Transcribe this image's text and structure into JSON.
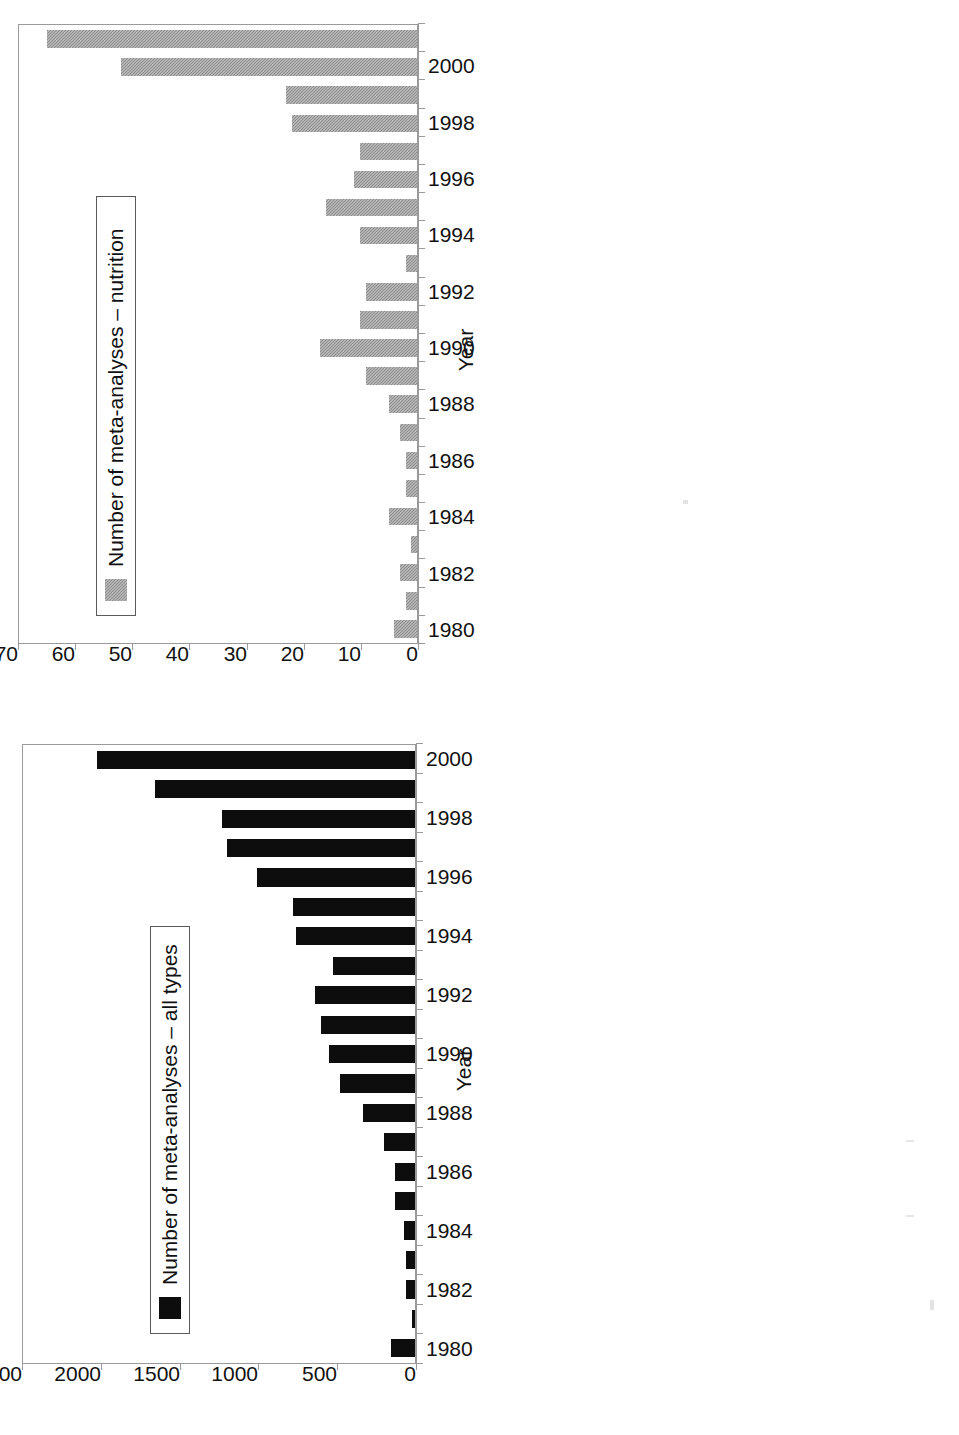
{
  "page": {
    "orientation_note": "landscape figure rotated 90 degrees counter-clockwise on the page",
    "panel_count": 2
  },
  "panels": [
    {
      "id": "all-types",
      "legend_label": "Number of meta-analyses – all types",
      "legend_swatch_color": "#0d0d0d",
      "xaxis_title": "Year",
      "ytick_labels": [
        "2500",
        "2000",
        "1500",
        "1000",
        "500",
        "0"
      ],
      "xtick_labels": [
        "1980",
        "1982",
        "1984",
        "1986",
        "1988",
        "1990",
        "1992",
        "1994",
        "1996",
        "1998",
        "2000"
      ]
    },
    {
      "id": "nutrition",
      "legend_label": "Number of meta-analyses – nutrition",
      "legend_swatch_color": "#8f8f8f",
      "xaxis_title": "Year",
      "ytick_labels": [
        "70",
        "60",
        "50",
        "40",
        "30",
        "20",
        "10",
        "0"
      ],
      "xtick_labels": [
        "1980",
        "1982",
        "1984",
        "1986",
        "1988",
        "1990",
        "1992",
        "1994",
        "1996",
        "1998",
        "2000"
      ]
    }
  ],
  "chart_data": [
    {
      "type": "bar",
      "title": "",
      "orientation": "vertical",
      "xlabel": "Year",
      "ylabel": "",
      "ylim": [
        0,
        2500
      ],
      "ytick_interval": 500,
      "grid": false,
      "legend_position": "inside-upper-left",
      "bar_color": "#0d0d0d",
      "series_name": "Number of meta-analyses – all types",
      "categories": [
        1980,
        1981,
        1982,
        1983,
        1984,
        1985,
        1986,
        1987,
        1988,
        1989,
        1990,
        1991,
        1992,
        1993,
        1994,
        1995,
        1996,
        1997,
        1998,
        1999,
        2000
      ],
      "values": [
        150,
        20,
        60,
        60,
        70,
        130,
        130,
        200,
        330,
        480,
        550,
        600,
        640,
        520,
        760,
        780,
        1010,
        1200,
        1230,
        1660,
        2030
      ]
    },
    {
      "type": "bar",
      "title": "",
      "orientation": "vertical",
      "xlabel": "Year",
      "ylabel": "",
      "ylim": [
        0,
        70
      ],
      "ytick_interval": 10,
      "grid": false,
      "legend_position": "inside-upper-left",
      "bar_color": "#8f8f8f",
      "series_name": "Number of meta-analyses – nutrition",
      "categories": [
        1980,
        1981,
        1982,
        1983,
        1984,
        1985,
        1986,
        1987,
        1988,
        1989,
        1990,
        1991,
        1992,
        1993,
        1994,
        1995,
        1996,
        1997,
        1998,
        1999,
        2000,
        2001
      ],
      "values": [
        4,
        2,
        3,
        1,
        5,
        2,
        2,
        3,
        5,
        9,
        17,
        10,
        9,
        2,
        10,
        16,
        11,
        10,
        22,
        23,
        52,
        65
      ]
    }
  ]
}
